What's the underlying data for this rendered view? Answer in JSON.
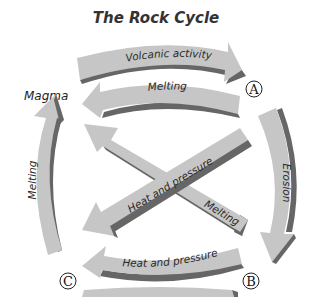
{
  "title": "The Rock Cycle",
  "colors": {
    "arrow_fill": "#c6c6c6",
    "arrow_shadow": "#666666",
    "text": "#2a2a2a",
    "background": "#ffffff"
  },
  "nodes": {
    "magma": "Magma",
    "a": "A",
    "b": "B",
    "c": "C"
  },
  "arrows": {
    "top_outer": "Volcanic activity",
    "top_inner": "Melting",
    "right": "Erosion",
    "left": "Melting",
    "diagonal_heat": "Heat and pressure",
    "diagonal_melting": "Melting",
    "bottom_inner": "Heat and pressure"
  }
}
